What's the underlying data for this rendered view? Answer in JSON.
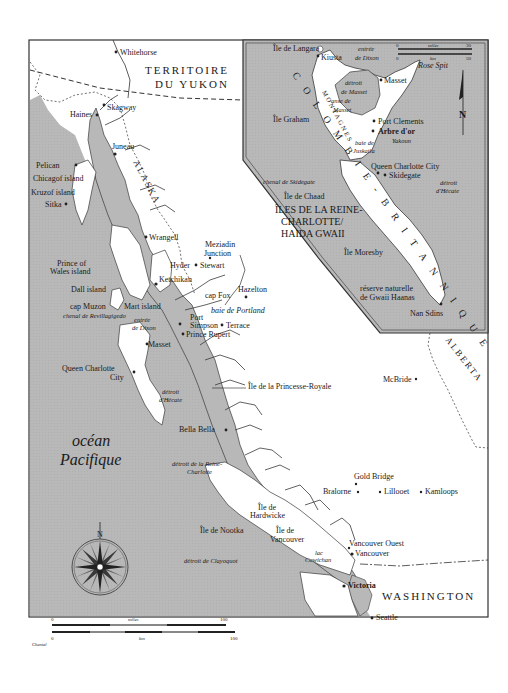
{
  "map": {
    "colors": {
      "water": "#b5b5b5",
      "land": "#ffffff",
      "border": "#333333",
      "coast": "#3a3a3a"
    },
    "regions": {
      "yukon": [
        "TERRITOIRE",
        "DU YUKON"
      ],
      "bc": "COLOMBIE-BRITANNIQUE",
      "bc_letters": [
        "C",
        "O",
        "L",
        "O",
        "M",
        "B",
        "I",
        "E",
        "-",
        "B",
        "R",
        "I",
        "T",
        "A",
        "N",
        "N",
        "I",
        "Q",
        "U",
        "E"
      ],
      "alaska": "ALASKA",
      "alberta": "ALBERTA",
      "washington": "WASHINGTON",
      "haida_gwaii": [
        "ÎLES DE LA REINE-",
        "CHARLOTTE/",
        "HAIDA GWAII"
      ]
    },
    "ocean": [
      "océan",
      "Pacifique"
    ],
    "places_main": [
      {
        "name": "Whitehorse"
      },
      {
        "name": "Skagway"
      },
      {
        "name": "Haines"
      },
      {
        "name": "Juneau"
      },
      {
        "name": "Pelican"
      },
      {
        "name": "Chicagof island"
      },
      {
        "name": "Kruzof island"
      },
      {
        "name": "Sitka"
      },
      {
        "name": "Wrangell"
      },
      {
        "name": "Meziadin"
      },
      {
        "name": "Junction"
      },
      {
        "name": "Prince of"
      },
      {
        "name": "Wales island"
      },
      {
        "name": "Hyder"
      },
      {
        "name": "Stewart"
      },
      {
        "name": "Ketchikan"
      },
      {
        "name": "Dall island"
      },
      {
        "name": "Hazelton"
      },
      {
        "name": "cap Fox"
      },
      {
        "name": "cap Muzon"
      },
      {
        "name": "Mart island"
      },
      {
        "name": "Port"
      },
      {
        "name": "Simpson"
      },
      {
        "name": "Terrace"
      },
      {
        "name": "Prince Rupert"
      },
      {
        "name": "Masset"
      },
      {
        "name": "Queen Charlotte"
      },
      {
        "name": "City"
      },
      {
        "name": "Île de la Princesse-Royale"
      },
      {
        "name": "McBride"
      },
      {
        "name": "Bella Bella"
      },
      {
        "name": "Gold Bridge"
      },
      {
        "name": "Bralorne"
      },
      {
        "name": "Lillooet"
      },
      {
        "name": "Kamloops"
      },
      {
        "name": "Île de"
      },
      {
        "name": "Hardwicke"
      },
      {
        "name": "Île de Nootka"
      },
      {
        "name": "Île de"
      },
      {
        "name": "Vancouver"
      },
      {
        "name": "Vancouver Ouest"
      },
      {
        "name": "Vancouver"
      },
      {
        "name": "Victoria"
      },
      {
        "name": "Seattle"
      }
    ],
    "water_labels_main": {
      "chenal": "chenal de Revillagigedo",
      "entree1": "entrée",
      "entree2": "de Dixon",
      "baie_portland": "baie de Portland",
      "hecate1": "détroit",
      "hecate2": "d'Hécate",
      "reine1": "détroit de la Reine-",
      "reine2": "Charlotte",
      "clayoquot": "détroit de Clayoquot",
      "lac1": "lac",
      "lac2": "Cowichan"
    },
    "inset": {
      "places": [
        "Île de Langara",
        "Kiusta",
        "Masset",
        "Rose Spit",
        "Île Graham",
        "Port Clements",
        "Arbre d'or",
        "Yakoun",
        "Queen Charlotte City",
        "Skidegate",
        "Île de Chaad",
        "Île Moresby",
        "Nan Sdins"
      ],
      "water": {
        "dixon1": "entrée",
        "dixon2": "de Dixon",
        "detroit_masset1": "détroit",
        "detroit_masset2": "de Masset",
        "anse1": "anse de",
        "anse2": "Masset",
        "baie1": "baie de",
        "baie2": "Juskatla",
        "chenal": "chenal de Skidegate",
        "hecate1": "détroit",
        "hecate2": "d'Hécate"
      },
      "montagnes": "MONTAGNES",
      "reserve1": "réserve naturelle",
      "reserve2": "de Gwaii Haanas",
      "scale": {
        "miles_label": "miles",
        "km_label": "km",
        "miles_start": "0",
        "miles_end": "30",
        "km_start": "0",
        "km_end": "50"
      },
      "north": "N"
    },
    "scale": {
      "miles_label": "miles",
      "km_label": "km",
      "miles_start": "0",
      "miles_end": "100",
      "km_start": "0",
      "km_end": "100"
    },
    "compass_north": "N",
    "credit": "Chantal"
  }
}
